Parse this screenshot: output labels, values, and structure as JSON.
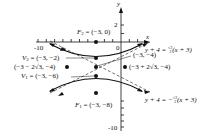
{
  "figure": {
    "type": "hyperbola-graph",
    "axes": {
      "x_label": "x",
      "y_label": "y",
      "x_tick_labels": {
        "neg10": "-10",
        "zero": "0"
      },
      "y_tick_labels": {
        "two": "2",
        "neg10": "-10"
      }
    },
    "points": {
      "f2": {
        "name": "F",
        "sub": "2",
        "coords": " = (−3, 0)"
      },
      "v2": {
        "name": "V",
        "sub": "2",
        "coords": " = (−3, −2)"
      },
      "center": {
        "coords": "(−3, −4)"
      },
      "left": {
        "coords": "(−3 − 2√3, −4)"
      },
      "right": {
        "coords": "(−3 + 2√3, −4)"
      },
      "v1": {
        "name": "V",
        "sub": "1",
        "coords": " = (−3, −6)"
      },
      "f1": {
        "name": "F",
        "sub": "1",
        "coords": " = (−3, −8)"
      }
    },
    "asymptotes": {
      "upper": {
        "lhs": "y + 4 = ",
        "frac_num": "√3",
        "frac_den": "3",
        "rhs": "(x + 3)"
      },
      "lower": {
        "lhs": "y + 4 = −",
        "frac_num": "√3",
        "frac_den": "3",
        "rhs": "(x + 3)"
      }
    },
    "colors": {
      "ink": "#111111",
      "background": "#ffffff"
    }
  }
}
